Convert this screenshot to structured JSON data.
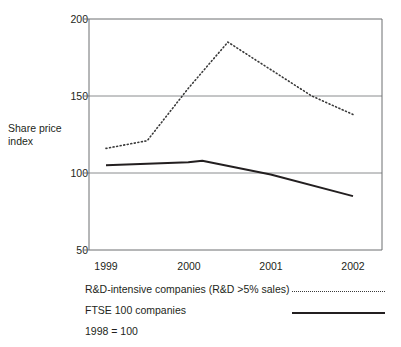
{
  "chart_data": {
    "type": "line",
    "title": "",
    "xlabel": "",
    "ylabel": "Share price index",
    "ylabel_lines": [
      "Share price",
      "index"
    ],
    "x": [
      1999,
      2000,
      2001,
      2002
    ],
    "xtick_labels": [
      "1999",
      "2000",
      "2001",
      "2002"
    ],
    "ytick_labels": [
      "50",
      "100",
      "150",
      "200"
    ],
    "yticks": [
      50,
      100,
      150,
      200
    ],
    "ylim": [
      50,
      200
    ],
    "xlim": [
      1999,
      2002
    ],
    "grid": "horizontal",
    "legend_position": "below",
    "series": [
      {
        "name": "R&D-intensive companies (R&D >5% sales)",
        "style": "dotted",
        "color": "#3a3a3a",
        "points": [
          {
            "x": 1999.0,
            "y": 116
          },
          {
            "x": 1999.5,
            "y": 121
          },
          {
            "x": 2000.0,
            "y": 155
          },
          {
            "x": 2000.48,
            "y": 185
          },
          {
            "x": 2001.5,
            "y": 150
          },
          {
            "x": 2002.0,
            "y": 138
          }
        ],
        "values": [
          116,
          155,
          150,
          138
        ]
      },
      {
        "name": "FTSE 100 companies",
        "style": "solid",
        "color": "#231f20",
        "points": [
          {
            "x": 1999.0,
            "y": 105
          },
          {
            "x": 2000.0,
            "y": 107
          },
          {
            "x": 2000.17,
            "y": 108
          },
          {
            "x": 2001.0,
            "y": 99
          },
          {
            "x": 2002.0,
            "y": 85
          }
        ],
        "values": [
          105,
          107,
          99,
          85
        ]
      }
    ],
    "annotations": [
      "1998 = 100"
    ]
  },
  "legend": {
    "items": [
      {
        "label": "R&D-intensive companies (R&D >5% sales)",
        "style": "dotted"
      },
      {
        "label": "FTSE 100 companies",
        "style": "solid"
      }
    ]
  },
  "footnote": "1998 = 100"
}
